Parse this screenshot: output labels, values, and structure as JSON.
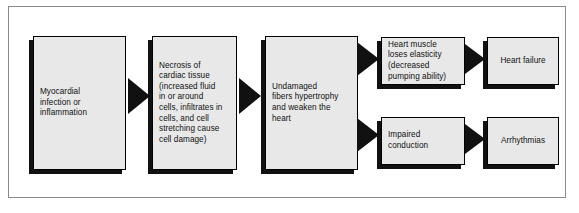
{
  "diagram": {
    "type": "flowchart",
    "direction": "left-to-right",
    "colors": {
      "node_fill": "#e8e8e8",
      "node_border": "#000000",
      "shadow": "#111111",
      "arrow": "#111111",
      "frame_border": "#8a8a8a",
      "background": "#ffffff"
    },
    "nodes": [
      {
        "id": "n1",
        "label": "Myocardial\ninfection or\ninflammation",
        "align": "left"
      },
      {
        "id": "n2",
        "label": "Necrosis of\ncardiac tissue\n(increased fluid\nin or around\ncells, infiltrates in\ncells, and cell\nstretching cause\ncell damage)",
        "align": "left"
      },
      {
        "id": "n3",
        "label": "Undamaged\nfibers hypertrophy\nand weaken the\nheart",
        "align": "left"
      },
      {
        "id": "n4",
        "label": "Heart muscle\nloses elasticity\n(decreased\npumping ability)",
        "align": "left"
      },
      {
        "id": "n5",
        "label": "Impaired\nconduction",
        "align": "left"
      },
      {
        "id": "n6",
        "label": "Heart failure",
        "align": "center"
      },
      {
        "id": "n7",
        "label": "Arrhythmias",
        "align": "center"
      }
    ],
    "edges": [
      {
        "id": "e1",
        "from": "n1",
        "to": "n2"
      },
      {
        "id": "e2",
        "from": "n2",
        "to": "n3"
      },
      {
        "id": "e3",
        "from": "n3",
        "to": "n4"
      },
      {
        "id": "e4",
        "from": "n3",
        "to": "n5"
      },
      {
        "id": "e5",
        "from": "n4",
        "to": "n6"
      },
      {
        "id": "e6",
        "from": "n5",
        "to": "n7"
      }
    ]
  }
}
